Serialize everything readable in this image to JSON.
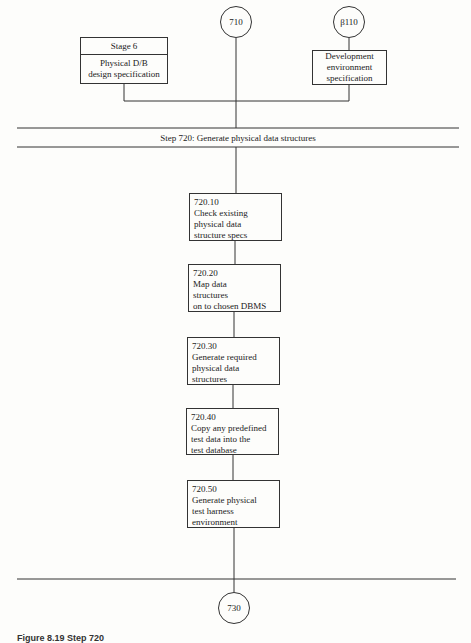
{
  "diagram": {
    "top_connectors": [
      {
        "id": "710",
        "label": "710"
      },
      {
        "id": "b110",
        "label": "β110"
      }
    ],
    "inputs": {
      "stage_box": {
        "header": "Stage 6",
        "lines": [
          "Physical D/B",
          "design specification"
        ]
      },
      "dev_box": {
        "lines": [
          "Development",
          "environment",
          "specification"
        ]
      }
    },
    "step_band": {
      "title": "Step 720:  Generate physical data structures"
    },
    "tasks": [
      {
        "number": "720.10",
        "lines": [
          "Check existing",
          "physical data",
          "structure specs"
        ]
      },
      {
        "number": "720.20",
        "lines": [
          "Map data",
          "structures",
          "on to chosen DBMS"
        ]
      },
      {
        "number": "720.30",
        "lines": [
          "Generate required",
          "physical data",
          "structures"
        ]
      },
      {
        "number": "720.40",
        "lines": [
          "Copy any predefined",
          "test data into the",
          "test database"
        ]
      },
      {
        "number": "720.50",
        "lines": [
          "Generate physical",
          "test harness",
          "environment"
        ]
      }
    ],
    "bottom_connector": {
      "label": "730"
    },
    "caption": "Figure 8.19  Step 720"
  }
}
